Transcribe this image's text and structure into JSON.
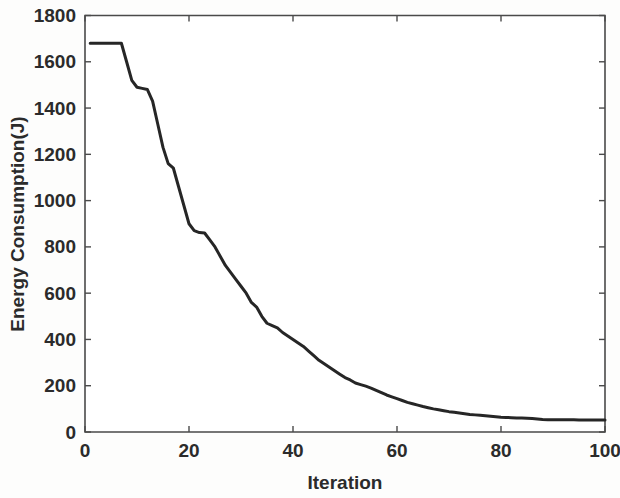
{
  "figure": {
    "background_color": "#fdfdfc",
    "plot_background_color": "#ffffff",
    "axis_color": "#4a4a4a",
    "line_color": "#262626"
  },
  "chart_data": {
    "type": "line",
    "title": "",
    "xlabel": "Iteration",
    "ylabel": "Energy Consumption(J)",
    "xlim": [
      0,
      100
    ],
    "ylim": [
      0,
      1800
    ],
    "xticks": [
      0,
      20,
      40,
      60,
      80,
      100
    ],
    "yticks": [
      0,
      200,
      400,
      600,
      800,
      1000,
      1200,
      1400,
      1600,
      1800
    ],
    "xtick_labels": [
      "0",
      "20",
      "40",
      "60",
      "80",
      "100"
    ],
    "ytick_labels": [
      "0",
      "200",
      "400",
      "600",
      "800",
      "1000",
      "1200",
      "1400",
      "1600",
      "1800"
    ],
    "grid": false,
    "legend": null,
    "series": [
      {
        "name": "Energy Consumption",
        "x": [
          1,
          2,
          3,
          4,
          5,
          6,
          7,
          8,
          9,
          10,
          11,
          12,
          13,
          14,
          15,
          16,
          17,
          18,
          19,
          20,
          21,
          22,
          23,
          24,
          25,
          26,
          27,
          28,
          29,
          30,
          31,
          32,
          33,
          34,
          35,
          36,
          37,
          38,
          39,
          40,
          41,
          42,
          43,
          44,
          45,
          46,
          47,
          48,
          49,
          50,
          51,
          52,
          53,
          54,
          55,
          56,
          57,
          58,
          59,
          60,
          61,
          62,
          63,
          64,
          65,
          66,
          67,
          68,
          69,
          70,
          71,
          72,
          73,
          74,
          75,
          76,
          77,
          78,
          79,
          80,
          81,
          82,
          83,
          84,
          85,
          86,
          87,
          88,
          89,
          90,
          91,
          92,
          93,
          94,
          95,
          96,
          97,
          98,
          99,
          100
        ],
        "y": [
          1680,
          1680,
          1680,
          1680,
          1680,
          1680,
          1680,
          1600,
          1520,
          1490,
          1485,
          1480,
          1430,
          1330,
          1230,
          1160,
          1140,
          1060,
          980,
          900,
          870,
          862,
          860,
          830,
          800,
          760,
          720,
          690,
          660,
          630,
          600,
          560,
          540,
          500,
          470,
          460,
          450,
          430,
          415,
          400,
          385,
          370,
          350,
          330,
          310,
          295,
          280,
          265,
          250,
          235,
          225,
          212,
          205,
          198,
          190,
          180,
          170,
          160,
          152,
          144,
          136,
          128,
          122,
          116,
          110,
          105,
          100,
          96,
          92,
          88,
          85,
          82,
          79,
          76,
          74,
          72,
          70,
          68,
          66,
          64,
          63,
          62,
          61,
          60,
          59,
          58,
          56,
          54,
          53,
          53,
          53,
          53,
          53,
          53,
          52,
          52,
          52,
          52,
          52,
          52
        ]
      }
    ]
  },
  "axes": {
    "x_title": "Iteration",
    "y_title": "Energy Consumption(J)"
  }
}
